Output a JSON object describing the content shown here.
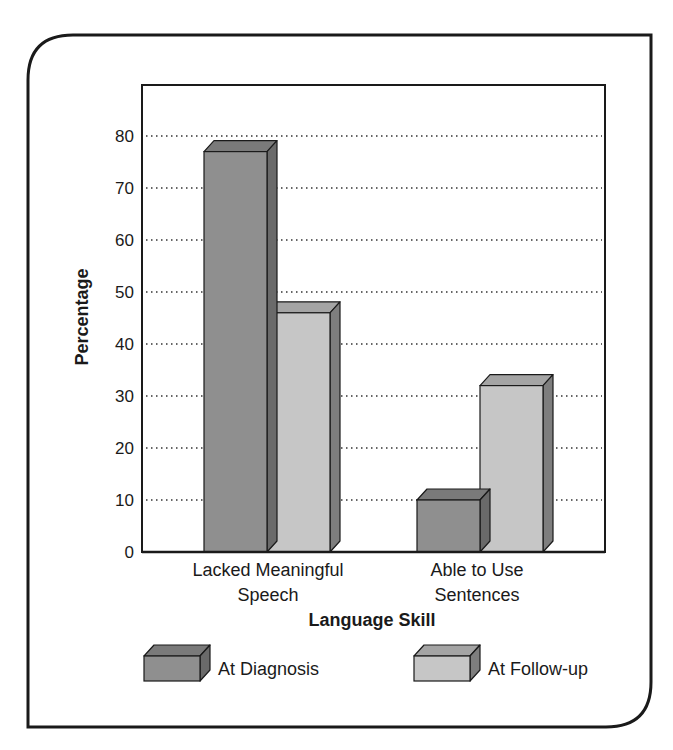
{
  "chart_data": {
    "type": "bar",
    "style": "3d-grouped",
    "title": "",
    "xlabel": "Language Skill",
    "ylabel": "Percentage",
    "categories": [
      [
        "Lacked Meaningful",
        "Speech"
      ],
      [
        "Able to Use",
        "Sentences"
      ]
    ],
    "category_labels": [
      "Lacked Meaningful Speech",
      "Able to Use Sentences"
    ],
    "series": [
      {
        "name": "At Diagnosis",
        "values": [
          77,
          10
        ],
        "color": "#8f8f8f",
        "top_color": "#7a7a7a",
        "side_color": "#6a6a6a"
      },
      {
        "name": "At Follow-up",
        "values": [
          46,
          32
        ],
        "color": "#c6c6c6",
        "top_color": "#a4a4a4",
        "side_color": "#7e7e7e"
      }
    ],
    "ylim": [
      0,
      90
    ],
    "yticks": [
      0,
      10,
      20,
      30,
      40,
      50,
      60,
      70,
      80
    ],
    "grid": "dotted-horizontal",
    "legend": {
      "position": "bottom",
      "entries": [
        "At Diagnosis",
        "At Follow-up"
      ]
    }
  }
}
